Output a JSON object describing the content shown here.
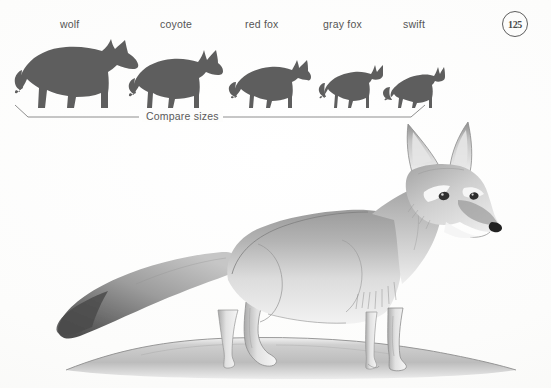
{
  "page": {
    "number_badge": "125",
    "background_color": "#fdfdfc",
    "ink_color": "#555555"
  },
  "comparison": {
    "caption": "Compare sizes",
    "silhouette_color": "#5f5f5f",
    "items": [
      {
        "label": "wolf",
        "relative_size": 1.0
      },
      {
        "label": "coyote",
        "relative_size": 0.72
      },
      {
        "label": "red fox",
        "relative_size": 0.57
      },
      {
        "label": "gray fox",
        "relative_size": 0.47
      },
      {
        "label": "swift",
        "relative_size": 0.42
      }
    ]
  },
  "illustration": {
    "subject": "swift-fox",
    "medium": "pencil-drawing",
    "ground_label": "ground-mound"
  }
}
